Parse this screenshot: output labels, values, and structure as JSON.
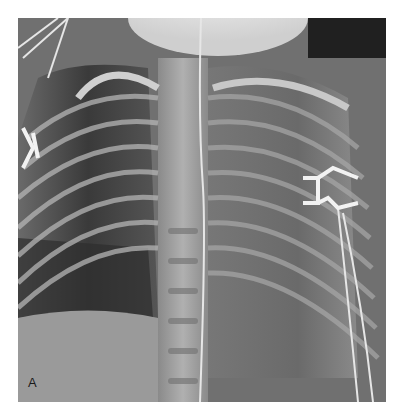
{
  "figure": {
    "panel_label": "A"
  },
  "colors": {
    "background": "#ffffff",
    "film_dark": "#2a2a2a",
    "film_mid": "#7a7a7a",
    "bone_bright": "#d8d8d8"
  }
}
